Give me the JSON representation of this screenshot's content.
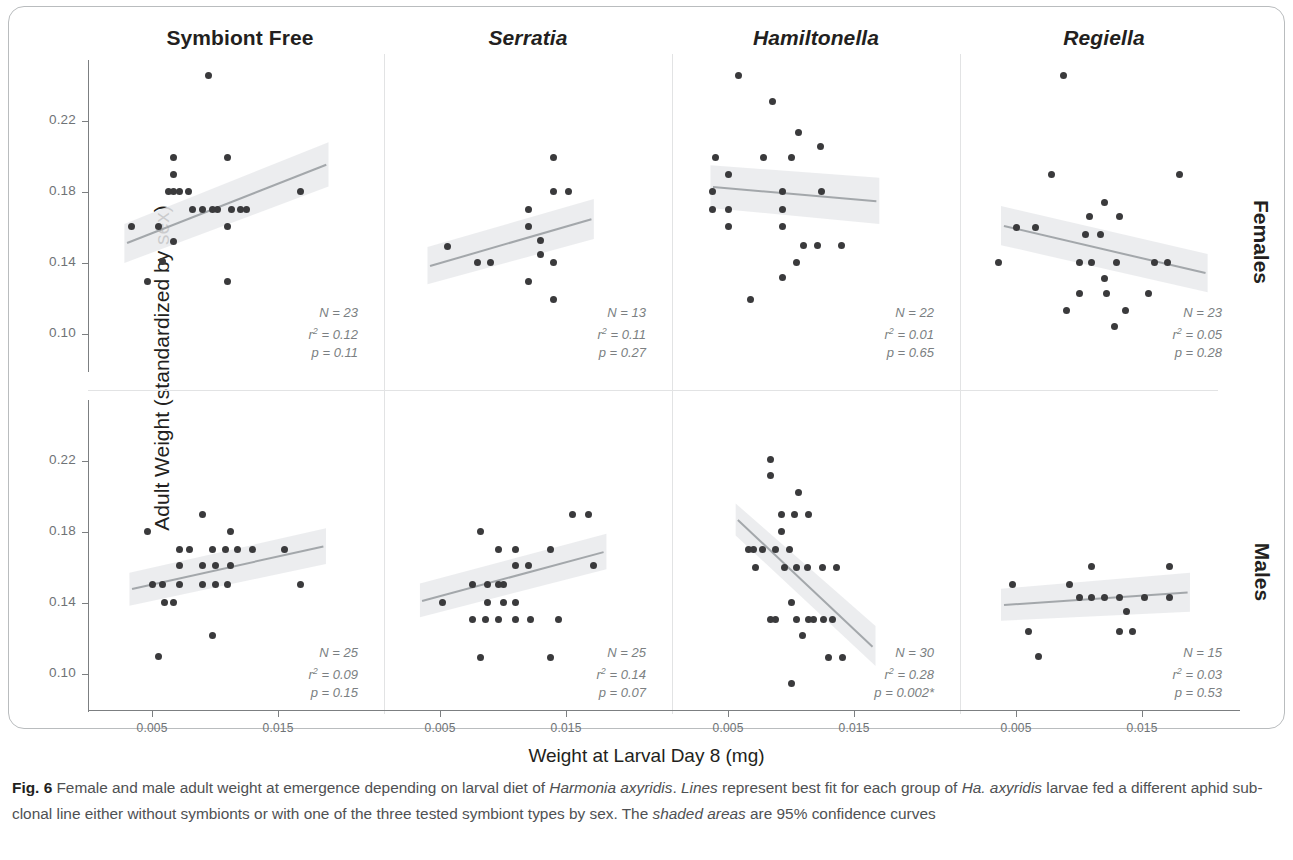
{
  "figure": {
    "label": "Fig. 6",
    "caption_parts": [
      {
        "text": "Fig. 6 ",
        "style": "bold"
      },
      {
        "text": "Female and male adult weight at emergence depending on larval diet of ",
        "style": "normal"
      },
      {
        "text": "Harmonia axyridis",
        "style": "italic"
      },
      {
        "text": ". ",
        "style": "normal"
      },
      {
        "text": "Lines",
        "style": "italic"
      },
      {
        "text": " represent best fit for each group of ",
        "style": "normal"
      },
      {
        "text": "Ha. axyridis",
        "style": "italic"
      },
      {
        "text": " larvae fed a different aphid sub-clonal line either without symbionts or with one of the three tested symbiont types by sex. The ",
        "style": "normal"
      },
      {
        "text": "shaded areas",
        "style": "italic"
      },
      {
        "text": " are 95% confidence curves",
        "style": "normal"
      }
    ]
  },
  "axes": {
    "x_title": "Weight at Larval Day 8 (mg)",
    "y_title": "Adult Weight (standardized by sex)",
    "x_ticks": [
      "0.005",
      "0.015"
    ],
    "x_tick_values": [
      0.005,
      0.015
    ],
    "y_ticks": [
      "0.22",
      "0.18",
      "0.14",
      "0.10"
    ],
    "y_tick_values": [
      0.22,
      0.18,
      0.14,
      0.1
    ],
    "xlim": [
      0.0015,
      0.0215
    ],
    "ylim": [
      0.082,
      0.252
    ]
  },
  "columns": [
    {
      "id": "symbiont-free",
      "label": "Symbiont Free",
      "italic": false
    },
    {
      "id": "serratia",
      "label": "Serratia",
      "italic": true
    },
    {
      "id": "hamiltonella",
      "label": "Hamiltonella",
      "italic": true
    },
    {
      "id": "regiella",
      "label": "Regiella",
      "italic": true
    }
  ],
  "rows": [
    {
      "id": "females",
      "label": "Females"
    },
    {
      "id": "males",
      "label": "Males"
    }
  ],
  "chart_data": {
    "type": "scatter",
    "title": "Female and male adult weight at emergence depending on larval diet of Harmonia axyridis",
    "xlabel": "Weight at Larval Day 8 (mg)",
    "ylabel": "Adult Weight (standardized by sex)",
    "xlim": [
      0.0015,
      0.0215
    ],
    "ylim": [
      0.082,
      0.252
    ],
    "xticks": [
      0.005,
      0.015
    ],
    "yticks": [
      0.1,
      0.14,
      0.18,
      0.22
    ],
    "grid": false,
    "legend": "none",
    "facet_cols": [
      "Symbiont Free",
      "Serratia",
      "Hamiltonella",
      "Regiella"
    ],
    "facet_rows": [
      "Females",
      "Males"
    ],
    "panels": [
      {
        "row": "Females",
        "col": "Symbiont Free",
        "stats": {
          "N": "N = 23",
          "r2": "r² = 0.12",
          "p": "p = 0.11"
        },
        "fit": {
          "x1": 0.003,
          "y1": 0.1515,
          "x2": 0.0188,
          "y2": 0.1955
        },
        "ci": {
          "x1": 0.0028,
          "x2": 0.019,
          "y_top_1": 0.162,
          "y_top_2": 0.208,
          "y_bot_1": 0.14,
          "y_bot_2": 0.183
        },
        "points": [
          [
            0.0095,
            0.2455
          ],
          [
            0.0067,
            0.1995
          ],
          [
            0.011,
            0.1995
          ],
          [
            0.0067,
            0.19
          ],
          [
            0.0067,
            0.1805
          ],
          [
            0.0079,
            0.1805
          ],
          [
            0.0168,
            0.1805
          ],
          [
            0.009,
            0.17
          ],
          [
            0.0102,
            0.17
          ],
          [
            0.0113,
            0.17
          ],
          [
            0.0125,
            0.17
          ],
          [
            0.0034,
            0.1605
          ],
          [
            0.0055,
            0.1605
          ],
          [
            0.011,
            0.1605
          ],
          [
            0.0067,
            0.152
          ],
          [
            0.0058,
            0.141
          ],
          [
            0.0046,
            0.1295
          ],
          [
            0.011,
            0.1295
          ],
          [
            0.0082,
            0.17
          ],
          [
            0.0098,
            0.17
          ],
          [
            0.0063,
            0.1805
          ],
          [
            0.0072,
            0.1805
          ],
          [
            0.012,
            0.17
          ]
        ]
      },
      {
        "row": "Females",
        "col": "Serratia",
        "stats": {
          "N": "N = 13",
          "r2": "r² = 0.11",
          "p": "p = 0.27"
        },
        "fit": {
          "x1": 0.0042,
          "y1": 0.1385,
          "x2": 0.017,
          "y2": 0.1648
        },
        "ci": {
          "x1": 0.004,
          "x2": 0.0172,
          "y_top_1": 0.149,
          "y_top_2": 0.176,
          "y_bot_1": 0.128,
          "y_bot_2": 0.1535
        },
        "points": [
          [
            0.014,
            0.1995
          ],
          [
            0.014,
            0.1805
          ],
          [
            0.0152,
            0.1805
          ],
          [
            0.012,
            0.17
          ],
          [
            0.012,
            0.1605
          ],
          [
            0.0056,
            0.149
          ],
          [
            0.013,
            0.1525
          ],
          [
            0.008,
            0.1405
          ],
          [
            0.009,
            0.1405
          ],
          [
            0.014,
            0.1405
          ],
          [
            0.012,
            0.1295
          ],
          [
            0.014,
            0.1195
          ],
          [
            0.013,
            0.145
          ]
        ]
      },
      {
        "row": "Females",
        "col": "Hamiltonella",
        "stats": {
          "N": "N = 22",
          "r2": "r² = 0.01",
          "p": "p = 0.65"
        },
        "fit": {
          "x1": 0.0038,
          "y1": 0.183,
          "x2": 0.0168,
          "y2": 0.175
        },
        "ci": {
          "x1": 0.0036,
          "x2": 0.017,
          "y_top_1": 0.195,
          "y_top_2": 0.188,
          "y_bot_1": 0.171,
          "y_bot_2": 0.162
        },
        "points": [
          [
            0.0058,
            0.2455
          ],
          [
            0.0085,
            0.231
          ],
          [
            0.0106,
            0.2135
          ],
          [
            0.0123,
            0.2055
          ],
          [
            0.004,
            0.1995
          ],
          [
            0.0078,
            0.1995
          ],
          [
            0.01,
            0.1995
          ],
          [
            0.005,
            0.19
          ],
          [
            0.0038,
            0.1805
          ],
          [
            0.0093,
            0.1805
          ],
          [
            0.0124,
            0.1805
          ],
          [
            0.0038,
            0.17
          ],
          [
            0.005,
            0.17
          ],
          [
            0.0093,
            0.17
          ],
          [
            0.005,
            0.1605
          ],
          [
            0.0093,
            0.1605
          ],
          [
            0.011,
            0.15
          ],
          [
            0.0121,
            0.15
          ],
          [
            0.014,
            0.15
          ],
          [
            0.0104,
            0.1405
          ],
          [
            0.0093,
            0.132
          ],
          [
            0.0068,
            0.1195
          ]
        ]
      },
      {
        "row": "Females",
        "col": "Regiella",
        "stats": {
          "N": "N = 23",
          "r2": "r² = 0.05",
          "p": "p = 0.28"
        },
        "fit": {
          "x1": 0.004,
          "y1": 0.161,
          "x2": 0.02,
          "y2": 0.1345
        },
        "ci": {
          "x1": 0.0038,
          "x2": 0.0202,
          "y_top_1": 0.172,
          "y_top_2": 0.145,
          "y_bot_1": 0.15,
          "y_bot_2": 0.1235
        },
        "points": [
          [
            0.0088,
            0.2455
          ],
          [
            0.0078,
            0.19
          ],
          [
            0.018,
            0.19
          ],
          [
            0.012,
            0.174
          ],
          [
            0.0108,
            0.166
          ],
          [
            0.0132,
            0.166
          ],
          [
            0.005,
            0.16
          ],
          [
            0.0105,
            0.156
          ],
          [
            0.0117,
            0.156
          ],
          [
            0.0036,
            0.1405
          ],
          [
            0.01,
            0.1405
          ],
          [
            0.011,
            0.1405
          ],
          [
            0.013,
            0.1405
          ],
          [
            0.016,
            0.1405
          ],
          [
            0.017,
            0.1405
          ],
          [
            0.012,
            0.1315
          ],
          [
            0.01,
            0.123
          ],
          [
            0.0122,
            0.123
          ],
          [
            0.0155,
            0.123
          ],
          [
            0.009,
            0.1135
          ],
          [
            0.0137,
            0.1135
          ],
          [
            0.0128,
            0.104
          ],
          [
            0.0065,
            0.16
          ]
        ]
      },
      {
        "row": "Males",
        "col": "Symbiont Free",
        "stats": {
          "N": "N = 25",
          "r2": "r² = 0.09",
          "p": "p = 0.15"
        },
        "fit": {
          "x1": 0.0034,
          "y1": 0.148,
          "x2": 0.0186,
          "y2": 0.172
        },
        "ci": {
          "x1": 0.0032,
          "x2": 0.0188,
          "y_top_1": 0.157,
          "y_top_2": 0.182,
          "y_bot_1": 0.1385,
          "y_bot_2": 0.162
        },
        "points": [
          [
            0.009,
            0.19
          ],
          [
            0.0046,
            0.1805
          ],
          [
            0.0112,
            0.1805
          ],
          [
            0.0072,
            0.17
          ],
          [
            0.0098,
            0.17
          ],
          [
            0.0108,
            0.17
          ],
          [
            0.0118,
            0.17
          ],
          [
            0.0155,
            0.17
          ],
          [
            0.0072,
            0.161
          ],
          [
            0.009,
            0.161
          ],
          [
            0.0112,
            0.161
          ],
          [
            0.005,
            0.1505
          ],
          [
            0.0058,
            0.1505
          ],
          [
            0.0072,
            0.1505
          ],
          [
            0.009,
            0.1505
          ],
          [
            0.01,
            0.1505
          ],
          [
            0.011,
            0.1505
          ],
          [
            0.0168,
            0.1505
          ],
          [
            0.006,
            0.1405
          ],
          [
            0.0067,
            0.1405
          ],
          [
            0.0098,
            0.1215
          ],
          [
            0.0055,
            0.11
          ],
          [
            0.008,
            0.17
          ],
          [
            0.01,
            0.161
          ],
          [
            0.013,
            0.17
          ]
        ]
      },
      {
        "row": "Males",
        "col": "Serratia",
        "stats": {
          "N": "N = 25",
          "r2": "r² = 0.14",
          "p": "p = 0.07"
        },
        "fit": {
          "x1": 0.0036,
          "y1": 0.1415,
          "x2": 0.018,
          "y2": 0.169
        },
        "ci": {
          "x1": 0.0034,
          "x2": 0.0182,
          "y_top_1": 0.151,
          "y_top_2": 0.179,
          "y_bot_1": 0.132,
          "y_bot_2": 0.159
        },
        "points": [
          [
            0.0155,
            0.19
          ],
          [
            0.0168,
            0.19
          ],
          [
            0.0082,
            0.1805
          ],
          [
            0.0096,
            0.17
          ],
          [
            0.011,
            0.17
          ],
          [
            0.0138,
            0.17
          ],
          [
            0.011,
            0.161
          ],
          [
            0.0172,
            0.161
          ],
          [
            0.0076,
            0.1505
          ],
          [
            0.0088,
            0.1505
          ],
          [
            0.01,
            0.1505
          ],
          [
            0.0052,
            0.1405
          ],
          [
            0.0088,
            0.1405
          ],
          [
            0.011,
            0.1405
          ],
          [
            0.0076,
            0.1305
          ],
          [
            0.0086,
            0.1305
          ],
          [
            0.0096,
            0.1305
          ],
          [
            0.011,
            0.1305
          ],
          [
            0.0144,
            0.1305
          ],
          [
            0.0082,
            0.1095
          ],
          [
            0.0138,
            0.1095
          ],
          [
            0.0096,
            0.1505
          ],
          [
            0.012,
            0.161
          ],
          [
            0.01,
            0.1405
          ],
          [
            0.0122,
            0.1305
          ]
        ]
      },
      {
        "row": "Males",
        "col": "Hamiltonella",
        "stats": {
          "N": "N = 30",
          "r2": "r² = 0.28",
          "p": "p = 0.002*"
        },
        "fit": {
          "x1": 0.0058,
          "y1": 0.187,
          "x2": 0.0165,
          "y2": 0.1155
        },
        "ci": {
          "x1": 0.0056,
          "x2": 0.0167,
          "y_top_1": 0.196,
          "y_top_2": 0.127,
          "y_bot_1": 0.178,
          "y_bot_2": 0.1045
        },
        "points": [
          [
            0.0084,
            0.221
          ],
          [
            0.0084,
            0.212
          ],
          [
            0.0106,
            0.202
          ],
          [
            0.0092,
            0.19
          ],
          [
            0.0103,
            0.19
          ],
          [
            0.0114,
            0.19
          ],
          [
            0.0092,
            0.1805
          ],
          [
            0.0066,
            0.17
          ],
          [
            0.0077,
            0.17
          ],
          [
            0.0088,
            0.17
          ],
          [
            0.0099,
            0.17
          ],
          [
            0.0072,
            0.16
          ],
          [
            0.0104,
            0.16
          ],
          [
            0.0113,
            0.16
          ],
          [
            0.0136,
            0.16
          ],
          [
            0.01,
            0.1405
          ],
          [
            0.0084,
            0.1305
          ],
          [
            0.0104,
            0.1305
          ],
          [
            0.0114,
            0.1305
          ],
          [
            0.0126,
            0.1305
          ],
          [
            0.0133,
            0.1305
          ],
          [
            0.0109,
            0.1215
          ],
          [
            0.013,
            0.1095
          ],
          [
            0.0141,
            0.1095
          ],
          [
            0.01,
            0.0945
          ],
          [
            0.007,
            0.17
          ],
          [
            0.0095,
            0.16
          ],
          [
            0.0118,
            0.1305
          ],
          [
            0.0125,
            0.16
          ],
          [
            0.0088,
            0.1305
          ]
        ]
      },
      {
        "row": "Males",
        "col": "Regiella",
        "stats": {
          "N": "N = 15",
          "r2": "r² = 0.03",
          "p": "p = 0.53"
        },
        "fit": {
          "x1": 0.004,
          "y1": 0.139,
          "x2": 0.0186,
          "y2": 0.146
        },
        "ci": {
          "x1": 0.0038,
          "x2": 0.0188,
          "y_top_1": 0.148,
          "y_top_2": 0.157,
          "y_bot_1": 0.13,
          "y_bot_2": 0.135
        },
        "points": [
          [
            0.011,
            0.1605
          ],
          [
            0.0172,
            0.1605
          ],
          [
            0.0047,
            0.1505
          ],
          [
            0.0092,
            0.1505
          ],
          [
            0.011,
            0.143
          ],
          [
            0.0132,
            0.143
          ],
          [
            0.0152,
            0.143
          ],
          [
            0.0172,
            0.143
          ],
          [
            0.0138,
            0.135
          ],
          [
            0.006,
            0.124
          ],
          [
            0.0132,
            0.124
          ],
          [
            0.0142,
            0.124
          ],
          [
            0.0068,
            0.11
          ],
          [
            0.012,
            0.143
          ],
          [
            0.01,
            0.143
          ]
        ]
      }
    ]
  },
  "colors": {
    "point": "#3a3a3c",
    "fit_line": "#9fa3a6",
    "ci_band": "#e9eaec",
    "axis": "#7c7f81",
    "tick_label": "#6f7376",
    "text": "#231f20",
    "caption": "#4f5153",
    "card_border": "#b9bcbe"
  }
}
